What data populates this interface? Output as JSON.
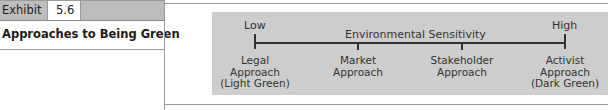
{
  "header": {
    "exhibit_label": "Exhibit",
    "exhibit_number": "5.6",
    "title": "Approaches to Being Green"
  },
  "diagram": {
    "axis_title": "Environmental Sensitivity",
    "low_label": "Low",
    "high_label": "High",
    "categories": [
      {
        "line1": "Legal",
        "line2": "Approach",
        "line3": "(Light Green)"
      },
      {
        "line1": "Market",
        "line2": "Approach",
        "line3": ""
      },
      {
        "line1": "Stakeholder",
        "line2": "Approach",
        "line3": ""
      },
      {
        "line1": "Activist",
        "line2": "Approach",
        "line3": "(Dark Green)"
      }
    ],
    "colors": {
      "box_background": "#cdcdcd",
      "axis": "#333333",
      "header_band": "#bdbdbd"
    }
  }
}
